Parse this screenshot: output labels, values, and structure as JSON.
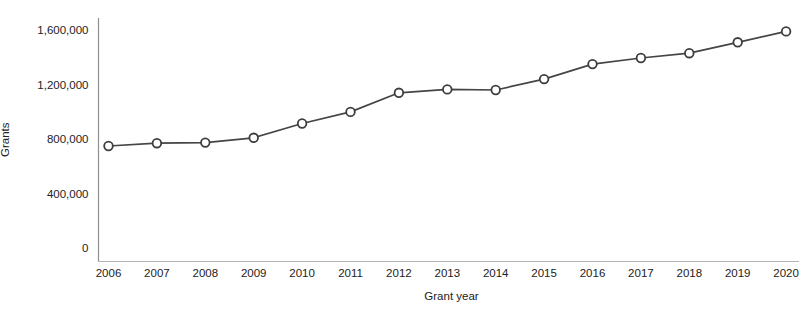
{
  "chart_data": {
    "type": "line",
    "title": "",
    "xlabel": "Grant year",
    "ylabel": "Grants",
    "x": [
      2006,
      2007,
      2008,
      2009,
      2010,
      2011,
      2012,
      2013,
      2014,
      2015,
      2016,
      2017,
      2018,
      2019,
      2020
    ],
    "values": [
      750000,
      770000,
      775000,
      810000,
      915000,
      1000000,
      1140000,
      1165000,
      1160000,
      1240000,
      1350000,
      1395000,
      1430000,
      1510000,
      1590000
    ],
    "ylim": [
      0,
      1600000
    ],
    "yticks": [
      0,
      400000,
      800000,
      1200000,
      1600000
    ],
    "ytick_labels": [
      "0",
      "400,000",
      "800,000",
      "1,200,000",
      "1,600,000"
    ],
    "grid": false,
    "legend": "none",
    "marker": "open-circle",
    "colors": {
      "line": "#454545",
      "marker_fill": "#ffffff",
      "marker_stroke": "#3e3e3e",
      "y_axis": "#8f8f8f",
      "x_axis": "#b3b3b3",
      "text": "#222222",
      "background": "#ffffff"
    }
  }
}
